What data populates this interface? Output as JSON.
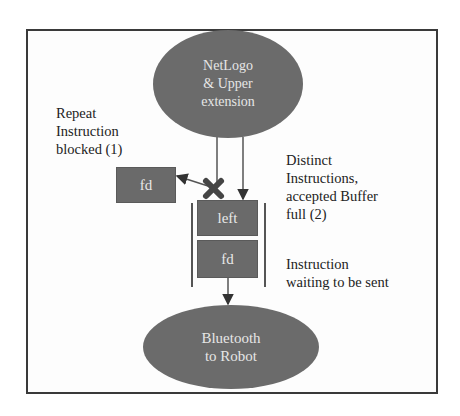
{
  "diagram": {
    "type": "flow",
    "nodes": {
      "source": {
        "label": "NetLogo\n& Upper\nextension",
        "shape": "ellipse"
      },
      "blocked": {
        "label": "fd",
        "shape": "box"
      },
      "buffer_top": {
        "label": "left",
        "shape": "box"
      },
      "buffer_bottom": {
        "label": "fd",
        "shape": "box"
      },
      "sink": {
        "label": "Bluetooth\nto Robot",
        "shape": "ellipse"
      }
    },
    "annotations": {
      "repeat": "Repeat\nInstruction\nblocked (1)",
      "distinct": "Distinct\nInstructions,\naccepted Buffer\nfull (2)",
      "waiting": "Instruction\nwaiting to be sent"
    },
    "edges": [
      {
        "from": "source",
        "to": "blocked",
        "note": "blocked at X mark"
      },
      {
        "from": "source",
        "to": "buffer_top"
      },
      {
        "from": "buffer_bottom",
        "to": "sink"
      }
    ],
    "colors": {
      "node_fill": "#6a6a6a",
      "node_text": "#e8e8e8",
      "line": "#444444",
      "frame": "#3a3a3a"
    },
    "icons": {
      "block_mark": "x-cross-icon"
    }
  }
}
